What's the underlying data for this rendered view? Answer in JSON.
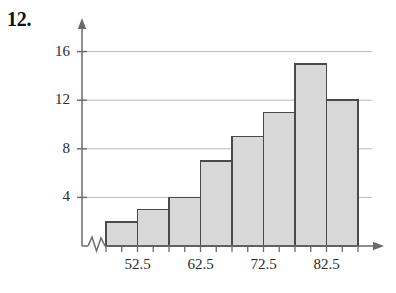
{
  "problem": {
    "number_label": "12."
  },
  "chart_data": {
    "type": "bar",
    "title": "",
    "subtitle": "",
    "xlabel": "",
    "ylabel": "",
    "categories": [
      "47.5-52.5",
      "52.5-57.5",
      "57.5-62.5",
      "62.5-67.5",
      "67.5-72.5",
      "72.5-77.5",
      "77.5-82.5",
      "82.5-87.5"
    ],
    "values": [
      2,
      3,
      4,
      7,
      9,
      11,
      15,
      12
    ],
    "bar_count": 8,
    "ylim": [
      0,
      17.5
    ],
    "yticks": [
      4,
      8,
      12,
      16
    ],
    "ytick_labels": [
      "4",
      "8",
      "12",
      "16"
    ],
    "xtick_labels": [
      "52.5",
      "62.5",
      "72.5",
      "82.5"
    ],
    "xtick_label_positions": [
      1,
      3,
      5,
      7
    ],
    "grid": true,
    "grid_axis": "y",
    "legend": null,
    "axis_break": true,
    "axis_break_note": "zigzag break on x-axis near origin",
    "bar_fill_color": "#d8d8d8",
    "bar_border_color": "#4a4a4a",
    "grid_color": "#b9b9b9",
    "axis_color": "#6a6a6a"
  }
}
